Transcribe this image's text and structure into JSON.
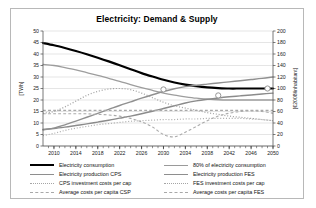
{
  "chart_data": {
    "type": "line",
    "title": "Electricity: Demand & Supply",
    "xlabel": "",
    "ylabel": "[TWh]",
    "y2label": "[€2008/inhabitant]",
    "xlim": [
      2008,
      2050
    ],
    "ylim": [
      0,
      50
    ],
    "y2lim": [
      0,
      200
    ],
    "grid": true,
    "legend_position": "bottom",
    "x_ticks": [
      2010,
      2014,
      2018,
      2022,
      2026,
      2030,
      2034,
      2038,
      2042,
      2046,
      2050
    ],
    "x_tick_labels": [
      "2010",
      "2014",
      "2018",
      "2022",
      "2026",
      "2030",
      "2034",
      "2038",
      "2042",
      "2046",
      "2050"
    ],
    "y_ticks": [
      0,
      5,
      10,
      15,
      20,
      25,
      30,
      35,
      40,
      45,
      50
    ],
    "y_tick_labels": [
      "0",
      "5",
      "10",
      "15",
      "20",
      "25",
      "30",
      "35",
      "40",
      "45",
      "50"
    ],
    "y2_ticks": [
      0,
      20,
      40,
      60,
      80,
      100,
      120,
      140,
      160,
      180,
      200
    ],
    "y2_tick_labels": [
      "0",
      "20",
      "40",
      "60",
      "80",
      "100",
      "120",
      "140",
      "160",
      "180",
      "200"
    ],
    "x": [
      2008,
      2010,
      2012,
      2014,
      2016,
      2018,
      2020,
      2022,
      2024,
      2026,
      2028,
      2030,
      2032,
      2034,
      2036,
      2038,
      2040,
      2042,
      2044,
      2046,
      2048,
      2050
    ],
    "series": [
      {
        "name": "Electricity consumption",
        "axis": "left",
        "style": "solid",
        "color": "#000000",
        "width": 2.2,
        "values": [
          44.8,
          43.8,
          42.6,
          41.3,
          39.9,
          38.4,
          36.8,
          35.1,
          33.4,
          31.7,
          30.2,
          28.8,
          27.6,
          26.7,
          26.0,
          25.5,
          25.2,
          25.0,
          25.0,
          25.0,
          25.0,
          25.0
        ]
      },
      {
        "name": "80% of electricity consumption",
        "axis": "left",
        "style": "solid",
        "color": "#9d9d9d",
        "width": 1.3,
        "markers": [
          {
            "x": 2030,
            "y": 24.6
          },
          {
            "x": 2040,
            "y": 22.0
          },
          {
            "x": 2049,
            "y": 25.0
          }
        ],
        "values": [
          35.5,
          35.0,
          34.1,
          33.1,
          31.9,
          30.7,
          29.4,
          28.1,
          26.7,
          25.4,
          24.2,
          23.0,
          22.1,
          21.4,
          20.8,
          20.4,
          20.1,
          20.0,
          20.0,
          20.0,
          20.0,
          20.0
        ]
      },
      {
        "name": "Electricity production CPS",
        "axis": "left",
        "style": "solid",
        "color": "#8b8b8b",
        "width": 1.4,
        "values": [
          7.2,
          7.6,
          8.2,
          8.9,
          9.6,
          10.4,
          11.2,
          12.1,
          13.0,
          14.0,
          15.1,
          16.3,
          17.5,
          18.7,
          19.6,
          20.3,
          20.9,
          21.4,
          21.8,
          22.2,
          22.6,
          23.0
        ]
      },
      {
        "name": "Electricity production FES",
        "axis": "left",
        "style": "solid",
        "color": "#909090",
        "width": 1.4,
        "values": [
          7.0,
          7.8,
          9.2,
          10.8,
          12.5,
          14.2,
          15.9,
          17.6,
          19.2,
          20.8,
          22.3,
          23.7,
          24.9,
          25.8,
          26.4,
          26.9,
          27.4,
          27.9,
          28.4,
          28.9,
          29.4,
          30.0
        ]
      },
      {
        "name": "CPS investment costs per cap",
        "axis": "right",
        "style": "dotted",
        "color": "#a6a6a6",
        "width": 1.2,
        "values": [
          57,
          60,
          68,
          78,
          88,
          95,
          99,
          100,
          98,
          92,
          84,
          76,
          70,
          66,
          62,
          58,
          55,
          52,
          50,
          48,
          46,
          44
        ]
      },
      {
        "name": "FES investment costs per cap",
        "axis": "right",
        "style": "dotted",
        "color": "#b0b0b0",
        "width": 1.2,
        "values": [
          18,
          22,
          27,
          31,
          34,
          37,
          39,
          41,
          43,
          44,
          45,
          46,
          46,
          47,
          47,
          48,
          48,
          48,
          48,
          47,
          46,
          44
        ]
      },
      {
        "name": "Average costs per capita CSP",
        "axis": "right",
        "style": "dashed",
        "color": "#a8a8a8",
        "width": 1.1,
        "values": [
          62,
          62,
          62,
          62,
          62,
          62,
          62,
          62,
          62,
          62,
          62,
          62,
          62,
          62,
          62,
          62,
          62,
          62,
          62,
          62,
          62,
          62
        ]
      },
      {
        "name": "Average costs per capita FES",
        "axis": "right",
        "style": "dashed",
        "color": "#aaaaaa",
        "width": 1.1,
        "values": [
          56,
          56,
          56,
          56,
          56,
          55,
          54,
          52,
          48,
          42,
          33,
          20,
          16,
          24,
          34,
          44,
          52,
          57,
          60,
          61,
          60,
          57
        ]
      }
    ]
  },
  "legend": {
    "left_column": [
      {
        "label": "Electricity consumption",
        "style": "thick-black"
      },
      {
        "label": "Electricity production CPS",
        "style": "solid-gray"
      },
      {
        "label": "CPS investment costs per cap",
        "style": "dotted"
      },
      {
        "label": "Average costs per capita CSP",
        "style": "dashed"
      }
    ],
    "right_column": [
      {
        "label": "80% of electricity consumption",
        "style": "solid-gray2"
      },
      {
        "label": "Electricity production FES",
        "style": "solid-gray"
      },
      {
        "label": "FES investment costs per cap",
        "style": "dotted"
      },
      {
        "label": "Average costs per capita FES",
        "style": "dashed"
      }
    ]
  }
}
